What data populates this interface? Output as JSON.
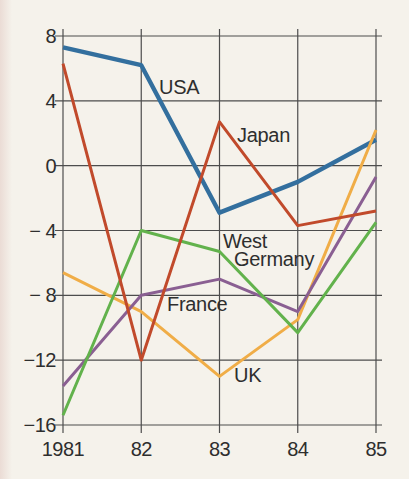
{
  "page": {
    "background_color": "#f5f2eb",
    "grid_color": "#4d4d4d",
    "text_color": "#2e2e2e"
  },
  "chart_data": {
    "type": "line",
    "title": "",
    "xlabel": "",
    "ylabel": "",
    "x": [
      1981,
      1982,
      1983,
      1984,
      1985
    ],
    "x_tick_labels": [
      "1981",
      "82",
      "83",
      "84",
      "85"
    ],
    "y_ticks": [
      8,
      4,
      0,
      -4,
      -8,
      -12,
      -16
    ],
    "y_tick_labels": [
      "8",
      "4",
      "0",
      "− 4",
      "− 8",
      "−12",
      "−16"
    ],
    "ylim": [
      -16,
      8
    ],
    "grid": true,
    "legend_position": "inline-labels",
    "series": [
      {
        "name": "USA",
        "values": [
          7.3,
          6.2,
          -2.9,
          -1.0,
          1.6
        ],
        "color": "#336f9e",
        "width": 4.4,
        "label": {
          "lines": [
            "USA"
          ],
          "x": 159,
          "y": 94,
          "indent": 0,
          "line_height": 18
        }
      },
      {
        "name": "Japan",
        "values": [
          6.3,
          -12.0,
          2.7,
          -3.7,
          -2.8
        ],
        "color": "#c14a2b",
        "width": 3,
        "label": {
          "lines": [
            "Japan"
          ],
          "x": 237,
          "y": 142,
          "indent": 0,
          "line_height": 18
        }
      },
      {
        "name": "West Germany",
        "values": [
          -15.4,
          -4.0,
          -5.3,
          -10.3,
          -3.5
        ],
        "color": "#62b24c",
        "width": 3,
        "label": {
          "lines": [
            "West",
            "Germany"
          ],
          "x": 223,
          "y": 248,
          "indent": 11,
          "line_height": 18
        }
      },
      {
        "name": "France",
        "values": [
          -13.6,
          -8.0,
          -7.0,
          -9.0,
          -0.7
        ],
        "color": "#8a5f92",
        "width": 3,
        "label": {
          "lines": [
            "France"
          ],
          "x": 167,
          "y": 311,
          "indent": 0,
          "line_height": 18
        }
      },
      {
        "name": "UK",
        "values": [
          -6.6,
          -9.0,
          -13.0,
          -9.5,
          2.2
        ],
        "color": "#f0ad47",
        "width": 3,
        "label": {
          "lines": [
            "UK"
          ],
          "x": 234,
          "y": 382,
          "indent": 0,
          "line_height": 18
        }
      }
    ],
    "draw_order": [
      "USA",
      "UK",
      "France",
      "West Germany",
      "Japan"
    ]
  },
  "layout": {
    "plot": {
      "left": 63,
      "right": 376,
      "top": 36,
      "bottom": 425
    },
    "grid_overshoot": {
      "top": 7,
      "bottom": 8,
      "left": 8,
      "right": 6
    },
    "y_label_right_x": 56,
    "y_label_baseline_offset": 7,
    "x_label_baseline_y": 456,
    "grid_stroke_width": 1.2
  }
}
